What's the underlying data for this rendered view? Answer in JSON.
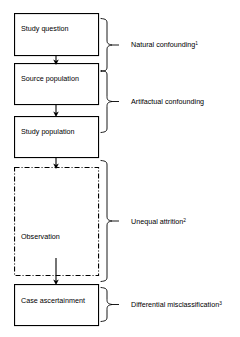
{
  "diagram": {
    "nodes": [
      {
        "id": "study-question",
        "label": "Study question",
        "x": 14,
        "y": 13,
        "w": 84,
        "h": 42,
        "style": "solid",
        "text_x": 21,
        "text_y": 31
      },
      {
        "id": "source-population",
        "label": "Source population",
        "x": 14,
        "y": 63,
        "w": 84,
        "h": 41,
        "style": "solid",
        "text_x": 21,
        "text_y": 81
      },
      {
        "id": "study-population",
        "label": "Study population",
        "x": 14,
        "y": 116,
        "w": 84,
        "h": 41,
        "style": "solid",
        "text_x": 21,
        "text_y": 134
      },
      {
        "id": "observation",
        "label": "Observation",
        "x": 14,
        "y": 167,
        "w": 84,
        "h": 108,
        "style": "dashdot",
        "text_x": 21,
        "text_y": 239
      },
      {
        "id": "case-ascertainment",
        "label": "Case ascertainment",
        "x": 14,
        "y": 284,
        "w": 84,
        "h": 41,
        "style": "solid",
        "text_x": 21,
        "text_y": 303
      }
    ],
    "arrows": [
      {
        "id": "arrow-question-to-source",
        "x": 56,
        "y1": 55,
        "y2": 62
      },
      {
        "id": "arrow-source-to-study",
        "x": 56,
        "y1": 104,
        "y2": 114
      },
      {
        "id": "arrow-study-to-observation",
        "x": 56,
        "y1": 157,
        "y2": 166
      },
      {
        "id": "arrow-observation-to-case",
        "x": 56,
        "y1": 258,
        "y2": 282
      }
    ],
    "annotations": [
      {
        "id": "natural-confounding",
        "text": "Natural confounding",
        "superscript": "1",
        "brace": {
          "x": 101,
          "top": 18,
          "bottom": 72,
          "tip_x": 112
        },
        "label_x": 131,
        "label_y": 47
      },
      {
        "id": "artifactual-confounding",
        "text": "Artifactual confounding",
        "superscript": "",
        "brace": {
          "x": 101,
          "top": 70,
          "bottom": 133,
          "tip_x": 112
        },
        "label_x": 131,
        "label_y": 104
      },
      {
        "id": "unequal-attrition",
        "text": "Unequal attrition",
        "superscript": "2",
        "brace": {
          "x": 101,
          "top": 160,
          "bottom": 282,
          "tip_x": 112
        },
        "label_x": 131,
        "label_y": 224
      },
      {
        "id": "differential-misclassification",
        "text": "Differential misclassification",
        "superscript": "3",
        "brace": {
          "x": 101,
          "top": 287,
          "bottom": 322,
          "tip_x": 112
        },
        "label_x": 131,
        "label_y": 307
      }
    ],
    "colors": {
      "background": "#ffffff",
      "stroke": "#000000",
      "text": "#000000"
    }
  }
}
